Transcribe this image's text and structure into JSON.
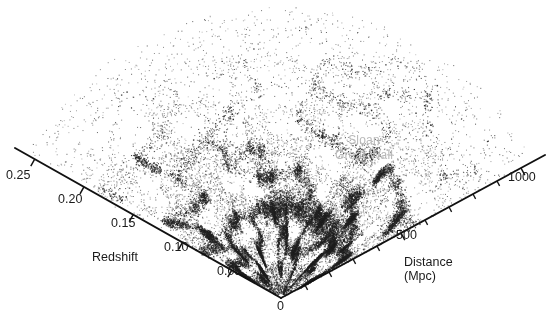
{
  "figure": {
    "type": "redshift-survey-cone",
    "background_color": "#ffffff",
    "point_color": "#202020",
    "axis_color": "#111111",
    "annotation_color": "#b9b9b9"
  },
  "annotations": [
    {
      "name": "sloan-great-wall",
      "line1": "Sloan",
      "line2": "Great Wall",
      "color": "#b9b9b9"
    }
  ],
  "axes": {
    "apex_label": "0",
    "left": {
      "title": "Redshift",
      "tick_labels": [
        "0.25",
        "0.20",
        "0.15",
        "0.10",
        "0.05"
      ],
      "ticks": [
        0.25,
        0.2,
        0.15,
        0.1,
        0.05
      ],
      "range": [
        0,
        0.27
      ]
    },
    "right": {
      "title_line1": "Distance",
      "title_line2": "(Mpc)",
      "tick_labels": [
        "500",
        "1000"
      ],
      "major_ticks": [
        500,
        1000
      ],
      "minor_ticks": [
        100,
        200,
        300,
        400,
        600,
        700,
        800,
        900
      ],
      "range": [
        0,
        1100
      ]
    }
  },
  "chart_data": {
    "type": "scatter",
    "title": "",
    "subtitle": "",
    "xlabel": "Distance (Mpc)",
    "ylabel": "Redshift",
    "grid": false,
    "legend": null,
    "point_count_approx": 40000,
    "radial_axis": {
      "name": "redshift",
      "ticks": [
        0,
        0.05,
        0.1,
        0.15,
        0.2,
        0.25
      ],
      "tick_labels": [
        "0",
        "0.05",
        "0.10",
        "0.15",
        "0.20",
        "0.25"
      ],
      "min": 0,
      "max": 0.27
    },
    "radial_axis_secondary": {
      "name": "distance_mpc",
      "ticks": [
        0,
        100,
        200,
        300,
        400,
        500,
        600,
        700,
        800,
        900,
        1000
      ],
      "labeled_ticks": [
        500,
        1000
      ],
      "min": 0,
      "max": 1100
    },
    "angular_extent_deg": 118,
    "density_profile": {
      "redshift_bins": [
        0.02,
        0.05,
        0.08,
        0.11,
        0.14,
        0.17,
        0.2,
        0.23,
        0.26
      ],
      "relative_density": [
        0.55,
        1.0,
        0.95,
        0.8,
        0.58,
        0.38,
        0.22,
        0.1,
        0.04
      ]
    },
    "features": [
      {
        "name": "Sloan Great Wall",
        "redshift": 0.08,
        "note": "prominent overdense wall spanning the right-central wedge"
      },
      {
        "name": "cosmic web filaments",
        "note": "interconnected overdense filaments"
      },
      {
        "name": "voids",
        "note": "empty regions bounded by filaments"
      }
    ]
  }
}
